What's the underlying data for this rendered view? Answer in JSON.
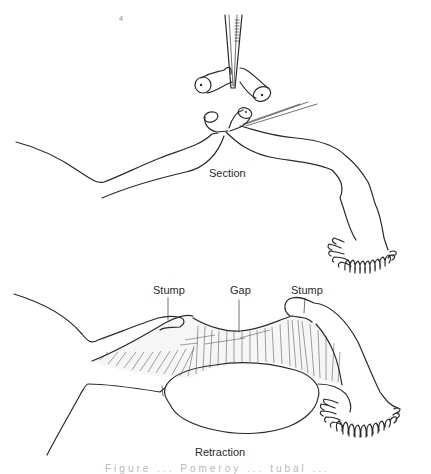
{
  "figure": {
    "top_panel": {
      "label": "Section",
      "elements": [
        "forceps-icon",
        "excised-tube-segment",
        "cut-tube-ends",
        "suture-thread",
        "fallopian-tube-left",
        "fallopian-tube-right",
        "fimbriae"
      ]
    },
    "bottom_panel": {
      "label": "Retraction",
      "annotations": [
        {
          "id": "stump-left",
          "text": "Stump"
        },
        {
          "id": "gap",
          "text": "Gap"
        },
        {
          "id": "stump-right",
          "text": "Stump"
        }
      ],
      "elements": [
        "uterine-fundus",
        "mesosalpinx",
        "ovary",
        "fimbriae"
      ]
    },
    "stray_mark": "4",
    "caption_partial": "Figure ... Pomeroy ... tubal ..."
  }
}
